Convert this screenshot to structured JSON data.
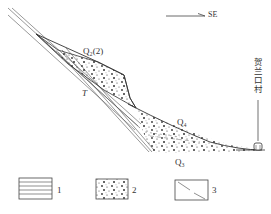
{
  "direction": {
    "label": "SE",
    "arrow": "right-arrow"
  },
  "labels": {
    "q2_2": "Q₂(2)",
    "t": "T",
    "q4": "Q₄",
    "q3": "Q₃",
    "village": "贺兰口村",
    "village_symbol": "village-icon"
  },
  "legend": [
    {
      "pattern": "horizontal-lines",
      "label": "1"
    },
    {
      "pattern": "gravel-dots",
      "label": "2"
    },
    {
      "pattern": "fault-diagonal",
      "label": "3"
    }
  ],
  "colors": {
    "line": "#444444",
    "background": "#ffffff"
  }
}
